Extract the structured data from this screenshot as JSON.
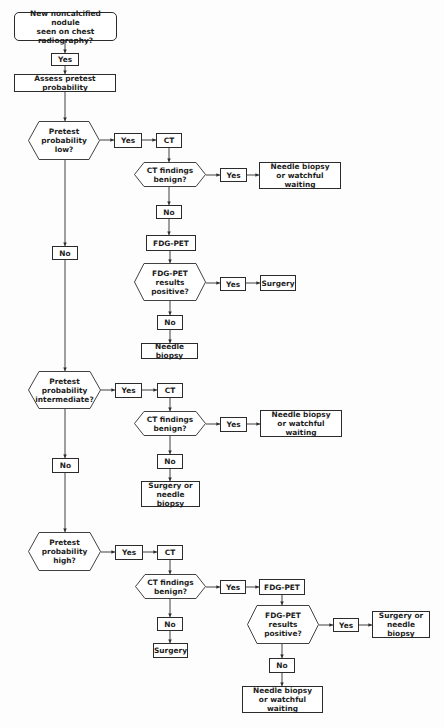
{
  "diagram": {
    "type": "flowchart",
    "stroke_color": "#2b2b2b",
    "background_color": "#fdfdfd",
    "nodes": {
      "start": "New noncalcified nodule\nseen on chest radiography?",
      "start_yes": "Yes",
      "assess": "Assess pretest probability",
      "low": {
        "question": "Pretest\nprobability\nlow?",
        "yes": "Yes",
        "ct": "CT",
        "ct_question": "CT findings\nbenign?",
        "ct_yes": "Yes",
        "ct_yes_outcome": "Needle biopsy\nor watchful waiting",
        "ct_no": "No",
        "pet": "FDG-PET",
        "pet_question": "FDG-PET\nresults\npositive?",
        "pet_yes": "Yes",
        "pet_yes_outcome": "Surgery",
        "pet_no": "No",
        "pet_no_outcome": "Needle biopsy",
        "no": "No"
      },
      "intermediate": {
        "question": "Pretest\nprobability\nintermediate?",
        "yes": "Yes",
        "ct": "CT",
        "ct_question": "CT findings\nbenign?",
        "ct_yes": "Yes",
        "ct_yes_outcome": "Needle biopsy\nor watchful waiting",
        "ct_no": "No",
        "ct_no_outcome": "Surgery or\nneedle biopsy",
        "no": "No"
      },
      "high": {
        "question": "Pretest\nprobability\nhigh?",
        "yes": "Yes",
        "ct": "CT",
        "ct_question": "CT findings\nbenign?",
        "ct_yes": "Yes",
        "pet": "FDG-PET",
        "pet_question": "FDG-PET\nresults\npositive?",
        "pet_yes": "Yes",
        "pet_yes_outcome": "Surgery or\nneedle biopsy",
        "pet_no": "No",
        "pet_no_outcome": "Needle biopsy\nor watchful waiting",
        "ct_no": "No",
        "ct_no_outcome": "Surgery"
      }
    }
  }
}
